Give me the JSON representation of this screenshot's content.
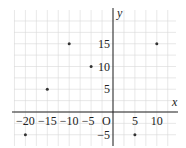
{
  "chart_data": {
    "type": "scatter",
    "title": "",
    "xlabel": "x",
    "ylabel": "y",
    "origin_label": "O",
    "xlim": [
      -22,
      15
    ],
    "ylim": [
      -7.5,
      22
    ],
    "grid": true,
    "grid_step": 2.5,
    "x_ticks": [
      -20,
      -15,
      -10,
      -5,
      5,
      10
    ],
    "x_tick_labels": [
      "−20",
      "−15",
      "−10",
      "−5",
      "5",
      "10"
    ],
    "y_ticks": [
      -5,
      5,
      10,
      15
    ],
    "y_tick_labels": [
      "−5",
      "5",
      "10",
      "15"
    ],
    "points": [
      {
        "x": -20,
        "y": -5
      },
      {
        "x": -15,
        "y": 5
      },
      {
        "x": -10,
        "y": 15
      },
      {
        "x": -5,
        "y": 10
      },
      {
        "x": 5,
        "y": -5
      },
      {
        "x": 10,
        "y": 15
      }
    ]
  }
}
